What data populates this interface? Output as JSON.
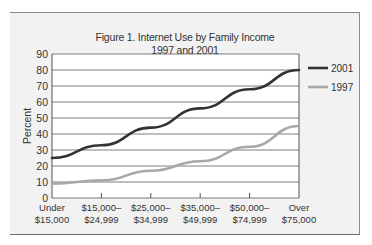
{
  "chart_data": {
    "type": "line",
    "title": "Figure 1. Internet Use by Family Income",
    "subtitle": "1997 and 2001",
    "xlabel": "",
    "ylabel": "Percent",
    "ylim": [
      0,
      90
    ],
    "yticks": [
      0,
      10,
      20,
      30,
      40,
      50,
      60,
      70,
      80,
      90
    ],
    "grid": true,
    "legend_position": "right",
    "categories": [
      [
        "Under",
        "$15,000"
      ],
      [
        "$15,000–",
        "$24,999"
      ],
      [
        "$25,000–",
        "$34,999"
      ],
      [
        "$35,000–",
        "$49,999"
      ],
      [
        "$50,000–",
        "$74,999"
      ],
      [
        "Over",
        "$75,000"
      ]
    ],
    "series": [
      {
        "name": "2001",
        "color": "#333333",
        "values": [
          25,
          33,
          44,
          56,
          68,
          80
        ]
      },
      {
        "name": "1997",
        "color": "#a8a8a8",
        "values": [
          9,
          11,
          17,
          23,
          32,
          45
        ]
      }
    ]
  }
}
